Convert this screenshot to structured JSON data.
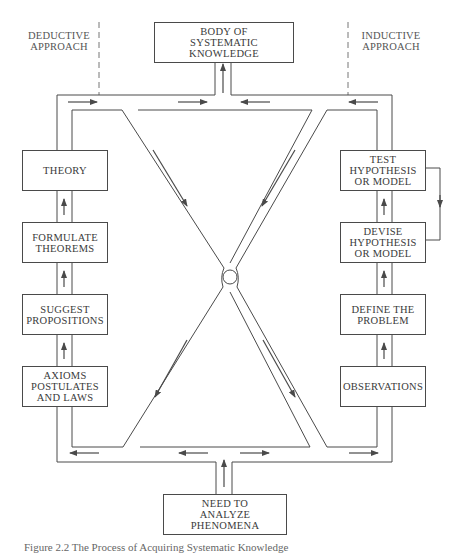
{
  "diagram": {
    "approach_labels": {
      "deductive": "DEDUCTIVE\nAPPROACH",
      "inductive": "INDUCTIVE\nAPPROACH"
    },
    "top_box": "BODY OF\nSYSTEMATIC KNOWLEDGE",
    "bottom_box": "NEED TO\nANALYZE PHENOMENA",
    "deductive_steps": [
      {
        "label": "THEORY"
      },
      {
        "label": "FORMULATE\nTHEOREMS"
      },
      {
        "label": "SUGGEST\nPROPOSITIONS"
      },
      {
        "label": "AXIOMS\nPOSTULATES\nAND LAWS"
      }
    ],
    "inductive_steps": [
      {
        "label": "TEST\nHYPOTHESIS\nOR MODEL"
      },
      {
        "label": "DEVISE\nHYPOTHESIS\nOR MODEL"
      },
      {
        "label": "DEFINE THE\nPROBLEM"
      },
      {
        "label": "OBSERVATIONS"
      }
    ],
    "center_node": "circle-junction",
    "colors": {
      "line": "#4a4a4a",
      "text": "#3a3a3a",
      "dashed": "#666666"
    }
  },
  "caption": "Figure 2.2  The Process of Acquiring Systematic Knowledge"
}
